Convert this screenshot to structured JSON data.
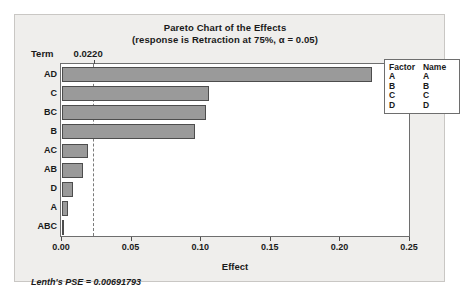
{
  "chart_data": {
    "type": "bar",
    "orientation": "horizontal",
    "title": "Pareto Chart of the Effects",
    "subtitle": "(response is Retraction at 75%, α = 0.05)",
    "xlabel": "Effect",
    "ylabel": "Term",
    "categories": [
      "AD",
      "C",
      "BC",
      "B",
      "AC",
      "AB",
      "D",
      "A",
      "ABC"
    ],
    "values": [
      0.223,
      0.1055,
      0.1035,
      0.0955,
      0.0185,
      0.015,
      0.008,
      0.004,
      0.001
    ],
    "xlim": [
      0.0,
      0.25
    ],
    "xticks": [
      "0.00",
      "0.05",
      "0.10",
      "0.15",
      "0.20",
      "0.25"
    ],
    "xtick_values": [
      0.0,
      0.05,
      0.1,
      0.15,
      0.2,
      0.25
    ],
    "reference_line": {
      "label": "0.0220",
      "value": 0.022
    },
    "grid": false,
    "bar_color": "#9a9a9a",
    "bar_border_color": "#4d4d4d",
    "legend_position": "right"
  },
  "footnote": "Lenth's PSE = 0.00691793",
  "legend": {
    "headers": [
      "Factor",
      "Name"
    ],
    "rows": [
      {
        "factor": "A",
        "name": "A"
      },
      {
        "factor": "B",
        "name": "B"
      },
      {
        "factor": "C",
        "name": "C"
      },
      {
        "factor": "D",
        "name": "D"
      }
    ]
  }
}
